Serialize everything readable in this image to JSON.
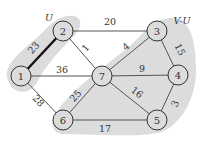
{
  "diagram": {
    "type": "graph",
    "colors": {
      "region_fill": "#dcdcdc",
      "node_stroke": "#333333",
      "node_fill": "#dcdcdc",
      "edge_stroke": "#555555",
      "highlight_edge": "#111111"
    },
    "regions": [
      {
        "id": "U",
        "label": "U",
        "nodes": [
          "1",
          "2"
        ]
      },
      {
        "id": "V-U",
        "label": "V-U",
        "nodes": [
          "3",
          "4",
          "5",
          "6",
          "7"
        ]
      }
    ],
    "nodes": [
      {
        "id": "1",
        "label": "1",
        "x": 21,
        "y": 76
      },
      {
        "id": "2",
        "label": "2",
        "x": 63,
        "y": 31
      },
      {
        "id": "3",
        "label": "3",
        "x": 157,
        "y": 31
      },
      {
        "id": "4",
        "label": "4",
        "x": 178,
        "y": 75
      },
      {
        "id": "5",
        "label": "5",
        "x": 157,
        "y": 120
      },
      {
        "id": "6",
        "label": "6",
        "x": 63,
        "y": 120
      },
      {
        "id": "7",
        "label": "7",
        "x": 102,
        "y": 76
      }
    ],
    "edges": [
      {
        "from": "1",
        "to": "2",
        "weight": "23",
        "highlighted": true
      },
      {
        "from": "2",
        "to": "3",
        "weight": "20",
        "highlighted": false
      },
      {
        "from": "2",
        "to": "7",
        "weight": "1",
        "highlighted": false
      },
      {
        "from": "1",
        "to": "7",
        "weight": "36",
        "highlighted": false
      },
      {
        "from": "1",
        "to": "6",
        "weight": "28",
        "highlighted": false
      },
      {
        "from": "3",
        "to": "7",
        "weight": "4",
        "highlighted": false
      },
      {
        "from": "3",
        "to": "4",
        "weight": "15",
        "highlighted": false
      },
      {
        "from": "7",
        "to": "4",
        "weight": "9",
        "highlighted": false
      },
      {
        "from": "7",
        "to": "6",
        "weight": "25",
        "highlighted": false
      },
      {
        "from": "7",
        "to": "5",
        "weight": "16",
        "highlighted": false
      },
      {
        "from": "4",
        "to": "5",
        "weight": "3",
        "highlighted": false
      },
      {
        "from": "6",
        "to": "5",
        "weight": "17",
        "highlighted": false
      }
    ]
  }
}
